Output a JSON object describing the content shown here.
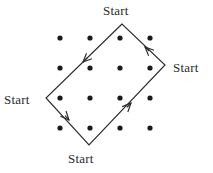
{
  "figure": {
    "background_color": "#ffffff",
    "stroke_color": "#2b2b2b",
    "dot_color": "#1a1a1a"
  },
  "labels": {
    "top": "Start",
    "right": "Start",
    "left": "Start",
    "bottom": "Start"
  },
  "chart_data": {
    "type": "scatter",
    "title": "",
    "xlabel": "",
    "ylabel": "",
    "grid": false,
    "legend": null,
    "xlim": [
      0,
      213
    ],
    "ylim": [
      0,
      173
    ],
    "dot_grid": {
      "rows": 4,
      "cols": 4,
      "x_positions": [
        60,
        90,
        120,
        150
      ],
      "y_positions": [
        38,
        68,
        98,
        128
      ],
      "radius": 2.6,
      "count": 16
    },
    "path": {
      "closed": true,
      "orientation": "counterclockwise",
      "vertices": [
        {
          "name": "top",
          "x": 122,
          "y": 24
        },
        {
          "name": "left",
          "x": 46,
          "y": 98
        },
        {
          "name": "bottom",
          "x": 89,
          "y": 145
        },
        {
          "name": "right",
          "x": 165,
          "y": 65
        }
      ],
      "edges": [
        {
          "from": "top",
          "to": "left",
          "arrow_at_x": 83,
          "arrow_at_y": 62,
          "direction": "down-left"
        },
        {
          "from": "left",
          "to": "bottom",
          "arrow_at_x": 69,
          "arrow_at_y": 120,
          "direction": "down-right"
        },
        {
          "from": "bottom",
          "to": "right",
          "arrow_at_x": 131,
          "arrow_at_y": 103,
          "direction": "up-right"
        },
        {
          "from": "right",
          "to": "top",
          "arrow_at_x": 145,
          "arrow_at_y": 47,
          "direction": "up-left"
        }
      ]
    },
    "annotations": [
      {
        "text": "Start",
        "x": 122,
        "y": 11,
        "anchor": "middle",
        "near_vertex": "top"
      },
      {
        "text": "Start",
        "x": 190,
        "y": 68,
        "anchor": "middle",
        "near_vertex": "right"
      },
      {
        "text": "Start",
        "x": 22,
        "y": 100,
        "anchor": "middle",
        "near_vertex": "left"
      },
      {
        "text": "Start",
        "x": 89,
        "y": 159,
        "anchor": "middle",
        "near_vertex": "bottom"
      }
    ]
  }
}
